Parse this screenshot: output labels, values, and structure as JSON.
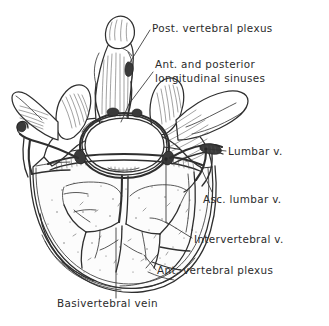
{
  "figure": {
    "title": "Vertebral venous plexus — lumbar vertebra, superior view",
    "background_color": "#ffffff",
    "ink_color": "#2f2f2f",
    "text_color": "#2b2b2b",
    "style": "hand-drawn pen-and-ink anatomical illustration"
  },
  "labels": [
    {
      "id": "post-vertebral-plexus",
      "text": "Post. vertebral plexus",
      "x": 152,
      "y": 32,
      "anchor": "start"
    },
    {
      "id": "ant-post-longitudinal-sinuses-line1",
      "text": "Ant. and posterior",
      "x": 155,
      "y": 68,
      "anchor": "start"
    },
    {
      "id": "ant-post-longitudinal-sinuses-line2",
      "text": "longitudinal sinuses",
      "x": 155,
      "y": 82,
      "anchor": "start"
    },
    {
      "id": "lumbar-v",
      "text": "Lumbar v.",
      "x": 228,
      "y": 155,
      "anchor": "start"
    },
    {
      "id": "asc-lumbar-v",
      "text": "Asc. lumbar v.",
      "x": 203,
      "y": 203,
      "anchor": "start"
    },
    {
      "id": "intervertebral-v",
      "text": "Intervertebral v.",
      "x": 194,
      "y": 243,
      "anchor": "start"
    },
    {
      "id": "ant-vertebral-plexus",
      "text": "Ant. vertebral plexus",
      "x": 157,
      "y": 274,
      "anchor": "start"
    },
    {
      "id": "basivertebral-vein",
      "text": "Basivertebral vein",
      "x": 57,
      "y": 307,
      "anchor": "start"
    }
  ],
  "structures": [
    {
      "id": "spinous-process",
      "name": "Spinous process"
    },
    {
      "id": "vertebral-foramen",
      "name": "Vertebral foramen"
    },
    {
      "id": "vertebral-body",
      "name": "Vertebral body (cut surface)"
    },
    {
      "id": "left-transverse-process",
      "name": "Left transverse process"
    },
    {
      "id": "right-transverse-process",
      "name": "Right transverse process"
    },
    {
      "id": "superior-articular-facet",
      "name": "Superior articular facet"
    },
    {
      "id": "basivertebral-vein-branches",
      "name": "Basivertebral venous branches"
    }
  ]
}
